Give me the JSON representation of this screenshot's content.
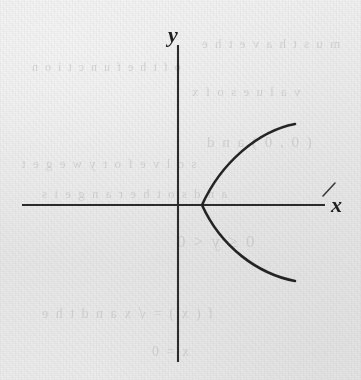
{
  "figure": {
    "background_color": "#e9e9e9",
    "ink_color": "#242424"
  },
  "axes": {
    "x_label": "x",
    "y_label": "y",
    "x_axis": {
      "y": 205,
      "x_start": 22,
      "x_end": 325
    },
    "y_axis": {
      "x": 178,
      "y_start": 45,
      "y_end": 362
    },
    "origin": {
      "x": 178,
      "y": 205
    },
    "tick_mark_near_x_label": "slash"
  },
  "ghost_text": [
    {
      "text": "m u s t   h a v e   t h e",
      "x": 200,
      "y": 36,
      "size": 13
    },
    {
      "text": "o f   t h e   f u n c t i o n",
      "x": 30,
      "y": 60,
      "size": 12
    },
    {
      "text": "v a l u e s   o f   x",
      "x": 190,
      "y": 84,
      "size": 13
    },
    {
      "text": "( 0 , 0 )   a n d",
      "x": 205,
      "y": 134,
      "size": 15
    },
    {
      "text": "s o l v e   f o r   y   w e   g e t",
      "x": 20,
      "y": 156,
      "size": 13
    },
    {
      "text": "a n d   s o   t h e   r a n g e   i s",
      "x": 40,
      "y": 186,
      "size": 13
    },
    {
      "text": "0   ≤   y   <   0",
      "x": 175,
      "y": 232,
      "size": 17
    },
    {
      "text": "f ( x )   =   √ x   a n d   t h e",
      "x": 40,
      "y": 306,
      "size": 14
    },
    {
      "text": "x   =   0",
      "x": 150,
      "y": 344,
      "size": 14
    }
  ],
  "chart_data": {
    "type": "line",
    "xlabel": "x",
    "ylabel": "y",
    "grid": false,
    "legend": null,
    "curves": [
      {
        "name": "rightward parabola",
        "description": "Sideways parabola with vertex slightly right of origin on the x-axis, opening toward positive x.",
        "vertex_px": {
          "x": 202,
          "y": 205
        },
        "upper_endpoint_px": {
          "x": 295,
          "y": 124
        },
        "lower_endpoint_px": {
          "x": 295,
          "y": 280
        },
        "path": "M 295,124 C 258,131 221,163 202,205 C 221,247 258,274 295,281"
      }
    ]
  }
}
